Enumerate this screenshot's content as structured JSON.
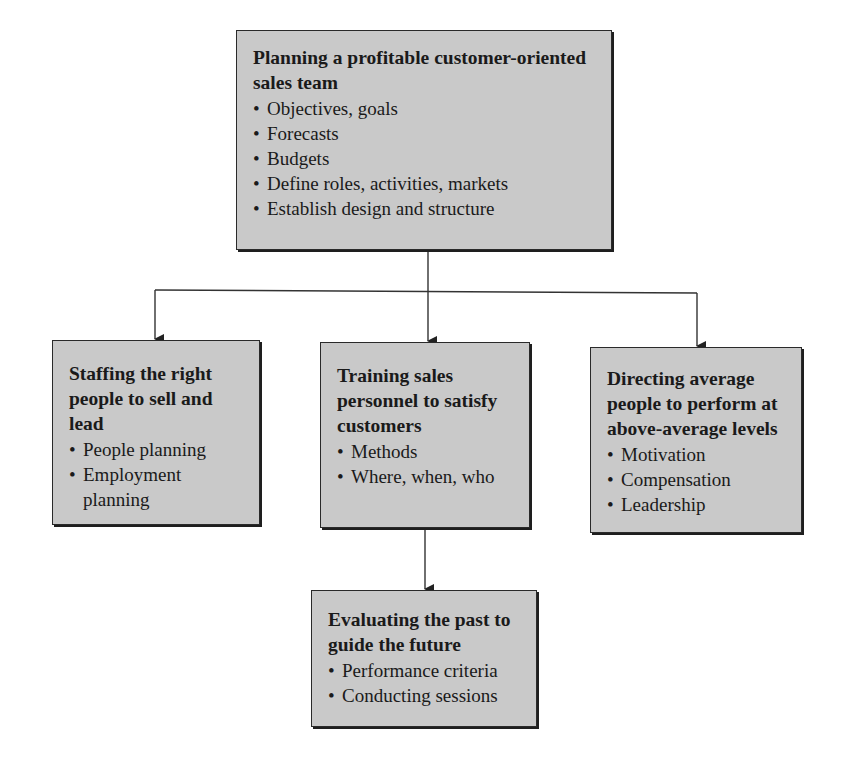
{
  "diagram": {
    "root": {
      "title": "Planning a profitable customer-oriented sales team",
      "items": [
        "Objectives, goals",
        "Forecasts",
        "Budgets",
        "Define roles, activities, markets",
        "Establish design and structure"
      ]
    },
    "children": [
      {
        "title": "Staffing the right people to sell and lead",
        "items": [
          "People planning",
          "Employment planning"
        ]
      },
      {
        "title": "Training sales personnel to satisfy customers",
        "items": [
          "Methods",
          "Where, when, who"
        ]
      },
      {
        "title": "Directing average people to perform at above-average levels",
        "items": [
          "Motivation",
          "Compensation",
          "Leadership"
        ]
      }
    ],
    "leaf": {
      "title": "Evaluating the past to guide the future",
      "items": [
        "Performance criteria",
        "Conducting sessions"
      ]
    },
    "colors": {
      "box_fill": "#c9c9c9",
      "border": "#2a2a2a",
      "line": "#333333"
    }
  }
}
